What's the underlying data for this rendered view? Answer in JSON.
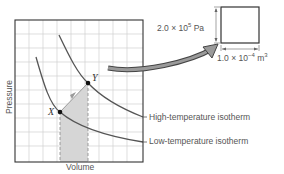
{
  "diagram": {
    "axes": {
      "x_label": "Volume",
      "y_label": "Pressure"
    },
    "points": {
      "x": {
        "label": "X"
      },
      "y": {
        "label": "Y"
      }
    },
    "isotherms": {
      "high": "High-temperature isotherm",
      "low": "Low-temperature isotherm"
    },
    "cell": {
      "pressure_mantissa": "2.0 × 10",
      "pressure_exp": "5",
      "pressure_unit": " Pa",
      "volume_mantissa": "1.0 × 10",
      "volume_exp": "−4",
      "volume_unit": " m",
      "volume_unit_exp": "3"
    },
    "colors": {
      "curve": "#555555",
      "grid": "#d0d0d0",
      "shade": "#d6d6d6",
      "arrow": "#888888",
      "frame": "#333333"
    }
  }
}
